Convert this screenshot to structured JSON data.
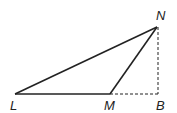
{
  "diagram": {
    "type": "geometry-triangle",
    "points": {
      "L": {
        "label": "L",
        "x": 15,
        "y": 94
      },
      "M": {
        "label": "M",
        "x": 110,
        "y": 94
      },
      "B": {
        "label": "B",
        "x": 158,
        "y": 94
      },
      "N": {
        "label": "N",
        "x": 157,
        "y": 27
      }
    },
    "solid_segments": [
      "LN",
      "LM",
      "MN"
    ],
    "dashed_segments": [
      "MB",
      "NB"
    ],
    "stroke_color": "#222222"
  }
}
